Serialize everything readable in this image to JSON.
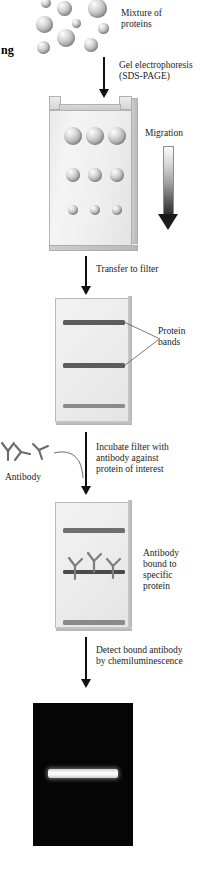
{
  "figure": {
    "title_fragment": "ng",
    "type": "western-blot-workflow"
  },
  "steps": {
    "mixture_label": "Mixture of\nproteins",
    "electrophoresis_label": "Gel electrophoresis\n(SDS-PAGE)",
    "migration_label": "Migration",
    "transfer_label": "Transfer to filter",
    "protein_bands_label": "Protein\nbands",
    "antibody_label": "Antibody",
    "incubate_label": "Incubate filter with\nantibody against\nprotein of interest",
    "antibody_bound_label": "Antibody\nbound to\nspecific\nprotein",
    "detect_label": "Detect bound antibody\nby chemiluminescence"
  },
  "colors": {
    "band_dark": "#5c5c5c",
    "band_mid": "#6e6e6e",
    "band_light": "#8a8a8a",
    "film_background": "#050505",
    "film_band": "#ffffff",
    "arrow": "#111111",
    "text": "#1c1c1c"
  },
  "mixture_spheres": [
    {
      "x": 41,
      "y": 0,
      "d": 10
    },
    {
      "x": 57,
      "y": 2,
      "d": 15
    },
    {
      "x": 88,
      "y": 0,
      "d": 19
    },
    {
      "x": 37,
      "y": 17,
      "d": 17
    },
    {
      "x": 72,
      "y": 19,
      "d": 9
    },
    {
      "x": 97,
      "y": 22,
      "d": 11
    },
    {
      "x": 58,
      "y": 30,
      "d": 17
    },
    {
      "x": 84,
      "y": 38,
      "d": 14
    },
    {
      "x": 38,
      "y": 42,
      "d": 13
    }
  ],
  "gel_spheres": {
    "row1": {
      "y": 128,
      "d": 17,
      "xs": [
        66,
        88,
        110
      ]
    },
    "row2": {
      "y": 168,
      "d": 13,
      "xs": [
        68,
        90,
        112
      ]
    },
    "row3": {
      "y": 205,
      "d": 9,
      "xs": [
        70,
        92,
        114
      ]
    }
  },
  "filter1_bands": [
    {
      "y": 320,
      "h": 5,
      "color": "#5c5c5c",
      "x": 62,
      "w": 64
    },
    {
      "y": 363,
      "h": 5,
      "color": "#5c5c5c",
      "x": 62,
      "w": 64
    },
    {
      "y": 404,
      "h": 4,
      "color": "#8a8a8a",
      "x": 62,
      "w": 64
    }
  ],
  "filter2_bands": [
    {
      "y": 529,
      "h": 5,
      "color": "#6e6e6e",
      "x": 62,
      "w": 64
    },
    {
      "y": 570,
      "h": 4,
      "color": "#4a4a4a",
      "x": 62,
      "w": 64
    },
    {
      "y": 620,
      "h": 5,
      "color": "#8a8a8a",
      "x": 62,
      "w": 64
    }
  ],
  "film_band": {
    "x": 64,
    "y": 769,
    "w": 62,
    "h": 8
  }
}
